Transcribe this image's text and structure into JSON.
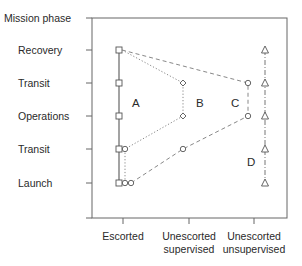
{
  "diagram": {
    "y_axis_title": "Mission phase",
    "phases": [
      "Recovery",
      "Transit",
      "Operations",
      "Transit",
      "Launch"
    ],
    "x_categories": [
      {
        "line1": "Escorted",
        "line2": ""
      },
      {
        "line1": "Unescorted",
        "line2": "supervised"
      },
      {
        "line1": "Unescorted",
        "line2": "unsupervised"
      }
    ],
    "regions": [
      "A",
      "B",
      "C",
      "D"
    ],
    "marker_shapes": {
      "A": "square",
      "B": "diamond",
      "C": "circle",
      "D": "triangle"
    },
    "line_styles": {
      "A": "solid",
      "B": "dotted",
      "C": "dashed",
      "D": "dash-dot"
    },
    "colors": {
      "frame": "#555555",
      "lines": "#777777",
      "text": "#2a2a2a"
    }
  }
}
